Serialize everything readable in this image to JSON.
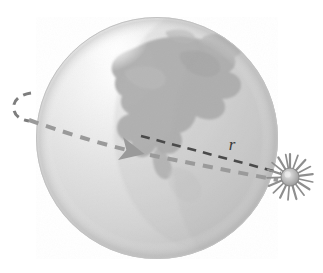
{
  "figure": {
    "background_color": "#ffffff",
    "width": 323,
    "height": 273
  },
  "globe": {
    "name": "earth-globe",
    "center_x": 157,
    "center_y": 138,
    "radius": 121,
    "body_color": "#d8d8d8",
    "highlight_color": "#fdfdfd",
    "shadow_color": "#b9b9b9",
    "edge_color": "#cfcfcf",
    "landmass_label": "North America",
    "landmass_color": "#a9a9a9"
  },
  "sun": {
    "name": "sun-symbol",
    "center_x": 290,
    "center_y": 177,
    "core_radius": 9,
    "spike_count": 18,
    "spike_length": 14,
    "core_color": "#b0b0b0",
    "spike_color": "#8e8e8e",
    "label": ""
  },
  "radius_line": {
    "name": "orbit-radius-line",
    "label": "r",
    "label_x": 232,
    "label_y": 150,
    "color": "#4a4a4a",
    "dash": "9 7",
    "stroke_width": 2.6,
    "x1": 141,
    "y1": 136,
    "x2": 281,
    "y2": 173
  },
  "orbit_path": {
    "name": "orbit-path",
    "color": "#9a9a9a",
    "dash": "10 8",
    "stroke_width": 4,
    "direction_label": "counterclockwise",
    "arrow_x": 140,
    "arrow_y": 152,
    "arrow_color": "#9a9a9a"
  },
  "orbit_tail": {
    "name": "orbit-tail-arc",
    "color": "#7d7d7d",
    "dash": "8 6",
    "stroke_width": 3
  }
}
